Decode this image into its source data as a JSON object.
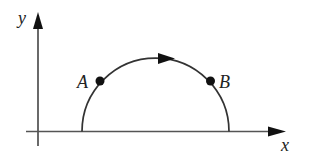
{
  "diagram": {
    "type": "semicircular-path",
    "axes": {
      "x_label": "x",
      "y_label": "y"
    },
    "points": [
      {
        "name": "A",
        "label": "A",
        "position": "left side of arc"
      },
      {
        "name": "B",
        "label": "B",
        "position": "right side of arc"
      }
    ],
    "direction": "clockwise (left to right across top)",
    "colors": {
      "line": "#333333",
      "background": "#ffffff"
    }
  }
}
